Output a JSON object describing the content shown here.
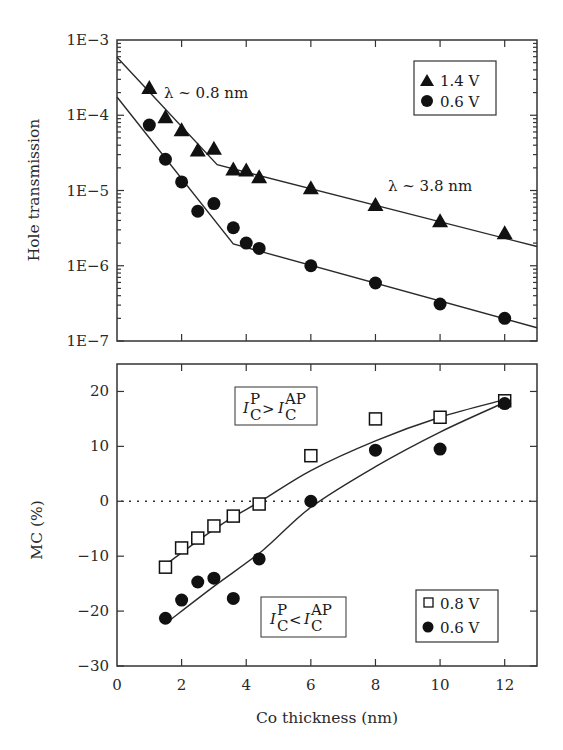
{
  "chart_data": [
    {
      "type": "scatter",
      "panel": "top",
      "title": "",
      "xlabel": "",
      "ylabel": "Hole transmission",
      "yscale": "log",
      "xlim": [
        0,
        13
      ],
      "ylim": [
        1e-07,
        0.001
      ],
      "xticks": [
        2,
        4,
        6,
        8,
        10,
        12
      ],
      "yticks": [
        0.001,
        0.0001,
        1e-05,
        1e-06,
        1e-07
      ],
      "ytick_labels": [
        "1E−3",
        "1E−4",
        "1E−5",
        "1E−6",
        "1E−7"
      ],
      "grid": false,
      "legend_position": "top-right",
      "annotations": [
        "λ ~ 0.8 nm",
        "λ ~ 3.8 nm"
      ],
      "series": [
        {
          "name": "1.4 V",
          "marker": "triangle",
          "x": [
            1,
            1.5,
            2,
            2.5,
            3,
            3.6,
            4,
            4.4,
            6,
            8,
            10,
            12
          ],
          "y": [
            0.00023,
            9.4e-05,
            6.3e-05,
            3.4e-05,
            3.6e-05,
            1.9e-05,
            1.85e-05,
            1.5e-05,
            1.07e-05,
            6.4e-06,
            3.9e-06,
            2.7e-06
          ],
          "fit": {
            "x": [
              0,
              3.1,
              13
            ],
            "y": [
              0.00059,
              2.2e-05,
              1.8e-06
            ]
          }
        },
        {
          "name": "0.6 V",
          "marker": "circle",
          "x": [
            1,
            1.5,
            2,
            2.5,
            3,
            3.6,
            4,
            4.4,
            6,
            8,
            10,
            12
          ],
          "y": [
            7.4e-05,
            2.6e-05,
            1.3e-05,
            5.3e-06,
            6.7e-06,
            3.2e-06,
            2e-06,
            1.7e-06,
            1e-06,
            5.9e-07,
            3.1e-07,
            2e-07
          ],
          "fit": {
            "x": [
              0,
              3.6,
              13
            ],
            "y": [
              0.000175,
              1.95e-06,
              1.5e-07
            ]
          }
        }
      ]
    },
    {
      "type": "scatter",
      "panel": "bottom",
      "title": "",
      "xlabel": "Co thickness (nm)",
      "ylabel": "MC (%)",
      "xlim": [
        0,
        13
      ],
      "ylim": [
        -30,
        25
      ],
      "xticks": [
        0,
        2,
        4,
        6,
        8,
        10,
        12
      ],
      "yticks": [
        20,
        10,
        0,
        -10,
        -20,
        -30
      ],
      "ytick_labels": [
        "20",
        "10",
        "0",
        "−10",
        "−20",
        "−30"
      ],
      "xtick_labels": [
        "0",
        "2",
        "4",
        "6",
        "8",
        "10",
        "12"
      ],
      "grid": false,
      "zero_line": "dotted",
      "legend_position": "bottom-right",
      "annotations": [
        {
          "main": "I",
          "sub": "C",
          "sup": "P",
          "op": ">",
          "main2": "I",
          "sub2": "C",
          "sup2": "AP"
        },
        {
          "main": "I",
          "sub": "C",
          "sup": "P",
          "op": "<",
          "main2": "I",
          "sub2": "C",
          "sup2": "AP"
        }
      ],
      "series": [
        {
          "name": "0.8 V",
          "marker": "open-square",
          "x": [
            1.5,
            2,
            2.5,
            3,
            3.6,
            4.4,
            6,
            8,
            10,
            12
          ],
          "y": [
            -12,
            -8.5,
            -6.7,
            -4.5,
            -2.7,
            -0.5,
            8.3,
            15,
            15.3,
            18.3
          ],
          "fit": {
            "x": [
              1.45,
              2.5,
              3.5,
              4.5,
              6,
              8,
              10,
              12
            ],
            "y": [
              -11.8,
              -7.2,
              -3.2,
              0.2,
              5.6,
              11,
              15.3,
              18.5
            ]
          }
        },
        {
          "name": "0.6 V",
          "marker": "circle",
          "x": [
            1.5,
            2,
            2.5,
            3,
            3.6,
            4.4,
            6,
            8,
            10,
            12
          ],
          "y": [
            -21.3,
            -18,
            -14.7,
            -14,
            -17.7,
            -10.5,
            0,
            9.3,
            9.5,
            17.8
          ],
          "fit": {
            "x": [
              1.65,
              3,
              4.5,
              6,
              8,
              10,
              12
            ],
            "y": [
              -21.6,
              -15.5,
              -9,
              -1.1,
              6.3,
              12.6,
              18
            ]
          }
        }
      ]
    }
  ]
}
